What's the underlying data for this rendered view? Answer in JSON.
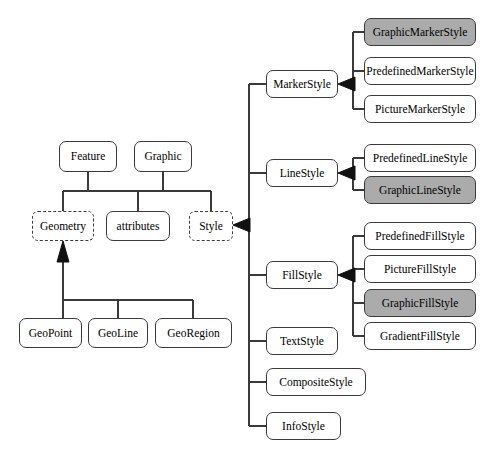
{
  "diagram": {
    "colors": {
      "shaded_fill": "#ababab",
      "plain_fill": "#ffffff",
      "stroke": "#3a3a3a",
      "background": "#ffffff"
    },
    "nodes": [
      {
        "id": "feature",
        "label": "Feature",
        "x": 59,
        "y": 141,
        "w": 58,
        "h": 31,
        "style": "solid",
        "fill": "plain"
      },
      {
        "id": "graphic",
        "label": "Graphic",
        "x": 134,
        "y": 141,
        "w": 58,
        "h": 31,
        "style": "solid",
        "fill": "plain"
      },
      {
        "id": "geometry",
        "label": "Geometry",
        "x": 32,
        "y": 211,
        "w": 62,
        "h": 30,
        "style": "dashed",
        "fill": "plain"
      },
      {
        "id": "attributes",
        "label": "attributes",
        "x": 106,
        "y": 211,
        "w": 64,
        "h": 30,
        "style": "solid",
        "fill": "plain"
      },
      {
        "id": "style",
        "label": "Style",
        "x": 189,
        "y": 211,
        "w": 44,
        "h": 30,
        "style": "dashed",
        "fill": "plain"
      },
      {
        "id": "geopoint",
        "label": "GeoPoint",
        "x": 19,
        "y": 318,
        "w": 63,
        "h": 30,
        "style": "solid",
        "fill": "plain"
      },
      {
        "id": "geoline",
        "label": "GeoLine",
        "x": 88,
        "y": 318,
        "w": 60,
        "h": 30,
        "style": "solid",
        "fill": "plain"
      },
      {
        "id": "georegion",
        "label": "GeoRegion",
        "x": 155,
        "y": 318,
        "w": 77,
        "h": 30,
        "style": "solid",
        "fill": "plain"
      },
      {
        "id": "markerstyle",
        "label": "MarkerStyle",
        "x": 266,
        "y": 70,
        "w": 72,
        "h": 28,
        "style": "solid",
        "fill": "plain"
      },
      {
        "id": "linestyle",
        "label": "LineStyle",
        "x": 266,
        "y": 159,
        "w": 72,
        "h": 28,
        "style": "solid",
        "fill": "plain"
      },
      {
        "id": "fillstyle",
        "label": "FillStyle",
        "x": 266,
        "y": 261,
        "w": 72,
        "h": 28,
        "style": "solid",
        "fill": "plain"
      },
      {
        "id": "textstyle",
        "label": "TextStyle",
        "x": 266,
        "y": 327,
        "w": 72,
        "h": 28,
        "style": "solid",
        "fill": "plain"
      },
      {
        "id": "compositestyle",
        "label": "CompositeStyle",
        "x": 266,
        "y": 368,
        "w": 100,
        "h": 28,
        "style": "solid",
        "fill": "plain"
      },
      {
        "id": "infostyle",
        "label": "InfoStyle",
        "x": 266,
        "y": 412,
        "w": 75,
        "h": 28,
        "style": "solid",
        "fill": "plain"
      },
      {
        "id": "graphicmarkerstyle",
        "label": "GraphicMarkerStyle",
        "x": 364,
        "y": 18,
        "w": 112,
        "h": 28,
        "style": "solid",
        "fill": "shaded"
      },
      {
        "id": "predefinedmarkerstyle",
        "label": "PredefinedMarkerStyle",
        "x": 364,
        "y": 57,
        "w": 112,
        "h": 28,
        "style": "solid",
        "fill": "plain"
      },
      {
        "id": "picturemarkerstyle",
        "label": "PictureMarkerStyle",
        "x": 364,
        "y": 95,
        "w": 112,
        "h": 28,
        "style": "solid",
        "fill": "plain"
      },
      {
        "id": "predefinedlinestyle",
        "label": "PredefinedLineStyle",
        "x": 364,
        "y": 144,
        "w": 112,
        "h": 28,
        "style": "solid",
        "fill": "plain"
      },
      {
        "id": "graphiclinestyle",
        "label": "GraphicLineStyle",
        "x": 364,
        "y": 176,
        "w": 112,
        "h": 28,
        "style": "solid",
        "fill": "shaded"
      },
      {
        "id": "predefinedfillstyle",
        "label": "PredefinedFillStyle",
        "x": 364,
        "y": 222,
        "w": 112,
        "h": 28,
        "style": "solid",
        "fill": "plain"
      },
      {
        "id": "picturefillstyle",
        "label": "PictureFillStyle",
        "x": 364,
        "y": 255,
        "w": 112,
        "h": 28,
        "style": "solid",
        "fill": "plain"
      },
      {
        "id": "graphicfillstyle",
        "label": "GraphicFillStyle",
        "x": 364,
        "y": 289,
        "w": 112,
        "h": 28,
        "style": "solid",
        "fill": "shaded"
      },
      {
        "id": "gradientfillstyle",
        "label": "GradientFillStyle",
        "x": 364,
        "y": 322,
        "w": 112,
        "h": 28,
        "style": "solid",
        "fill": "plain"
      }
    ]
  }
}
